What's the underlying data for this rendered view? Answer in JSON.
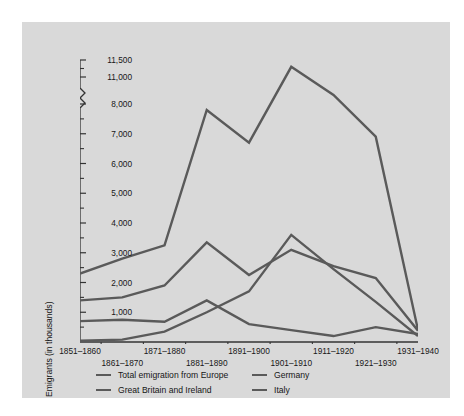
{
  "chart_data": {
    "type": "line",
    "title": "",
    "subtitle": "",
    "xlabel": "",
    "ylabel": "Emigrants (in thousands)",
    "grid": false,
    "legend_position": "bottom",
    "axis_break": {
      "between": [
        8000,
        11000
      ],
      "note": "y-axis broken between 8,000 and 11,000"
    },
    "ylim": [
      0,
      11500
    ],
    "y_major_ticks": [
      1000,
      2000,
      3000,
      4000,
      5000,
      6000,
      7000,
      8000,
      11000,
      11500
    ],
    "y_tick_labels": [
      "1,000",
      "2,000",
      "3,000",
      "4,000",
      "5,000",
      "6,000",
      "7,000",
      "8,000",
      "11,000",
      "11,500"
    ],
    "y_minor_ticks": [
      500,
      1500,
      2500,
      3500,
      4500,
      5500,
      6500,
      7500,
      11250
    ],
    "categories": [
      "1851–1860",
      "1861–1870",
      "1871–1880",
      "1881–1890",
      "1891–1900",
      "1901–1910",
      "1911–1920",
      "1921–1930",
      "1931–1940"
    ],
    "series": [
      {
        "name": "Total emigration from Europe",
        "color": "#5a5a5a",
        "values": [
          2300,
          2800,
          3250,
          7800,
          6700,
          11300,
          9000,
          6900,
          400
        ]
      },
      {
        "name": "Great Britain and Ireland",
        "color": "#5a5a5a",
        "values": [
          1400,
          1500,
          1900,
          3350,
          2250,
          3100,
          2550,
          2150,
          380
        ]
      },
      {
        "name": "Germany",
        "color": "#5a5a5a",
        "values": [
          700,
          750,
          680,
          1400,
          600,
          400,
          200,
          500,
          270
        ]
      },
      {
        "name": "Italy",
        "color": "#5a5a5a",
        "values": [
          40,
          80,
          350,
          1000,
          1700,
          3600,
          2450,
          1350,
          200
        ]
      }
    ]
  },
  "axis": {
    "y_label": "Emigrants (in thousands)",
    "y_ticks": [
      "11,500",
      "11,000",
      "8,000",
      "7,000",
      "6,000",
      "5,000",
      "4,000",
      "3,000",
      "2,000",
      "1,000"
    ],
    "x_ticks_top": [
      "1851–1860",
      "1871–1880",
      "1891–1900",
      "1911–1920",
      "1931–1940"
    ],
    "x_ticks_bottom": [
      "1861–1870",
      "1881–1890",
      "1901–1910",
      "1921–1930"
    ]
  },
  "legend": {
    "items": [
      {
        "label": "Total emigration from Europe"
      },
      {
        "label": "Germany"
      },
      {
        "label": "Great Britain and Ireland"
      },
      {
        "label": "Italy"
      }
    ]
  },
  "colors": {
    "page_background": "#ffffff",
    "panel_background": "#d9d9d9",
    "line": "#5a5a5a",
    "axis": "#333333",
    "text": "#161616"
  }
}
